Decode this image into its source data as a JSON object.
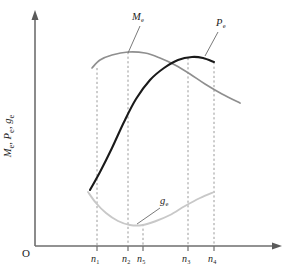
{
  "figure": {
    "background_color": "#ffffff",
    "origin_label": "O",
    "y_axis_title_parts": [
      "M",
      "e",
      ", ",
      "P",
      "e",
      ", ",
      "g",
      "e"
    ],
    "y_axis_title_text": "Me, Pe, ge"
  },
  "chart_data": {
    "type": "line",
    "title": "",
    "xlabel": "",
    "ylabel": "Me, Pe, ge",
    "grid": false,
    "legend_position": "inline-annotations",
    "axis_style": "arrows",
    "xlim": [
      0,
      1
    ],
    "ylim": [
      0,
      1
    ],
    "x_ticks": [
      {
        "id": "n1",
        "label": "n1",
        "base": "n",
        "sub": "1",
        "px": 97
      },
      {
        "id": "n2",
        "label": "n2",
        "base": "n",
        "sub": "2",
        "px": 128
      },
      {
        "id": "n5",
        "label": "n5",
        "base": "n",
        "sub": "5",
        "px": 143
      },
      {
        "id": "n3",
        "label": "n3",
        "base": "n",
        "sub": "3",
        "px": 188
      },
      {
        "id": "n4",
        "label": "n4",
        "base": "n",
        "sub": "4",
        "px": 214
      }
    ],
    "guides": [
      {
        "tick": "n1",
        "x": 97,
        "y_top": 68,
        "y_bottom": 246
      },
      {
        "tick": "n2",
        "x": 128,
        "y_top": 52,
        "y_bottom": 246
      },
      {
        "tick": "n5",
        "x": 143,
        "y_top": 224,
        "y_bottom": 246
      },
      {
        "tick": "n3",
        "x": 188,
        "y_top": 58,
        "y_bottom": 246
      },
      {
        "tick": "n4",
        "x": 214,
        "y_top": 62,
        "y_bottom": 246
      }
    ],
    "series": [
      {
        "name": "Me",
        "base": "M",
        "sub": "e",
        "color": "#8f8f8f",
        "description": "torque curve, rises to maximum near n2 then falls",
        "label_pos": {
          "x": 132,
          "y": 12
        },
        "leader": {
          "x1": 140,
          "y1": 26,
          "x2": 128,
          "y2": 53
        },
        "points": [
          [
            92,
            68
          ],
          [
            100,
            60
          ],
          [
            112,
            55
          ],
          [
            128,
            52
          ],
          [
            145,
            53
          ],
          [
            160,
            58
          ],
          [
            175,
            65
          ],
          [
            190,
            74
          ],
          [
            205,
            84
          ],
          [
            222,
            94
          ],
          [
            240,
            103
          ]
        ]
      },
      {
        "name": "Pe",
        "base": "P",
        "sub": "e",
        "color": "#1a1a1a",
        "description": "power curve, rises steeply from n1 to maximum near n3 then slightly falls to n4",
        "label_pos": {
          "x": 216,
          "y": 18
        },
        "leader": {
          "x1": 218,
          "y1": 32,
          "x2": 205,
          "y2": 56
        },
        "points": [
          [
            90,
            190
          ],
          [
            100,
            172
          ],
          [
            112,
            148
          ],
          [
            124,
            122
          ],
          [
            136,
            99
          ],
          [
            150,
            80
          ],
          [
            164,
            68
          ],
          [
            178,
            60
          ],
          [
            192,
            57
          ],
          [
            203,
            58
          ],
          [
            214,
            62
          ]
        ]
      },
      {
        "name": "ge",
        "base": "g",
        "sub": "e",
        "color": "#c8c8c8",
        "description": "specific fuel consumption curve, U shaped with minimum near n5",
        "label_pos": {
          "x": 160,
          "y": 196
        },
        "leader": {
          "x1": 160,
          "y1": 208,
          "x2": 137,
          "y2": 224
        },
        "points": [
          [
            88,
            192
          ],
          [
            96,
            203
          ],
          [
            106,
            213
          ],
          [
            118,
            221
          ],
          [
            130,
            225
          ],
          [
            143,
            225
          ],
          [
            156,
            221
          ],
          [
            170,
            215
          ],
          [
            185,
            206
          ],
          [
            200,
            198
          ],
          [
            214,
            192
          ]
        ]
      }
    ]
  }
}
